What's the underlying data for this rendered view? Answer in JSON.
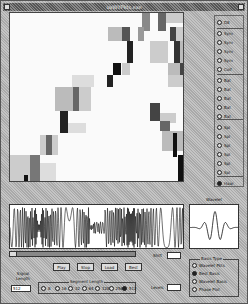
{
  "window": {
    "title": "uvWlfPkts.exe"
  },
  "plot": {
    "type": "time-frequency tiling",
    "cells": [
      {
        "x": 132,
        "y": 0,
        "w": 8,
        "h": 18,
        "c": "#888"
      },
      {
        "x": 148,
        "y": 0,
        "w": 8,
        "h": 18,
        "c": "#666"
      },
      {
        "x": 156,
        "y": 0,
        "w": 18,
        "h": 10,
        "c": "#ccc"
      },
      {
        "x": 98,
        "y": 14,
        "w": 16,
        "h": 14,
        "c": "#bbb"
      },
      {
        "x": 112,
        "y": 14,
        "w": 8,
        "h": 14,
        "c": "#555"
      },
      {
        "x": 128,
        "y": 14,
        "w": 6,
        "h": 14,
        "c": "#999"
      },
      {
        "x": 160,
        "y": 14,
        "w": 6,
        "h": 14,
        "c": "#444"
      },
      {
        "x": 166,
        "y": 14,
        "w": 8,
        "h": 14,
        "c": "#ccc"
      },
      {
        "x": 117,
        "y": 28,
        "w": 6,
        "h": 22,
        "c": "#222"
      },
      {
        "x": 140,
        "y": 28,
        "w": 18,
        "h": 22,
        "c": "#ccc"
      },
      {
        "x": 164,
        "y": 28,
        "w": 6,
        "h": 22,
        "c": "#333"
      },
      {
        "x": 170,
        "y": 28,
        "w": 8,
        "h": 22,
        "c": "#bbb"
      },
      {
        "x": 103,
        "y": 50,
        "w": 8,
        "h": 12,
        "c": "#111"
      },
      {
        "x": 112,
        "y": 50,
        "w": 8,
        "h": 12,
        "c": "#ccc"
      },
      {
        "x": 158,
        "y": 50,
        "w": 20,
        "h": 12,
        "c": "#bbb"
      },
      {
        "x": 170,
        "y": 50,
        "w": 6,
        "h": 12,
        "c": "#444"
      },
      {
        "x": 62,
        "y": 62,
        "w": 22,
        "h": 12,
        "c": "#ddd"
      },
      {
        "x": 97,
        "y": 62,
        "w": 6,
        "h": 12,
        "c": "#222"
      },
      {
        "x": 158,
        "y": 62,
        "w": 22,
        "h": 12,
        "c": "#ccc"
      },
      {
        "x": 45,
        "y": 74,
        "w": 18,
        "h": 24,
        "c": "#bbb"
      },
      {
        "x": 63,
        "y": 74,
        "w": 6,
        "h": 24,
        "c": "#666"
      },
      {
        "x": 69,
        "y": 74,
        "w": 12,
        "h": 24,
        "c": "#ccc"
      },
      {
        "x": 50,
        "y": 98,
        "w": 8,
        "h": 22,
        "c": "#222"
      },
      {
        "x": 58,
        "y": 110,
        "w": 18,
        "h": 10,
        "c": "#ddd"
      },
      {
        "x": 140,
        "y": 90,
        "w": 10,
        "h": 18,
        "c": "#444"
      },
      {
        "x": 150,
        "y": 100,
        "w": 16,
        "h": 10,
        "c": "#ccc"
      },
      {
        "x": 150,
        "y": 108,
        "w": 10,
        "h": 10,
        "c": "#666"
      },
      {
        "x": 30,
        "y": 122,
        "w": 18,
        "h": 20,
        "c": "#ccc"
      },
      {
        "x": 36,
        "y": 122,
        "w": 6,
        "h": 20,
        "c": "#666"
      },
      {
        "x": 152,
        "y": 118,
        "w": 26,
        "h": 20,
        "c": "#bbb"
      },
      {
        "x": 163,
        "y": 120,
        "w": 4,
        "h": 24,
        "c": "#111"
      },
      {
        "x": 0,
        "y": 142,
        "w": 22,
        "h": 28,
        "c": "#ccc"
      },
      {
        "x": 20,
        "y": 142,
        "w": 10,
        "h": 28,
        "c": "#777"
      },
      {
        "x": 30,
        "y": 150,
        "w": 16,
        "h": 18,
        "c": "#ddd"
      },
      {
        "x": 14,
        "y": 162,
        "w": 4,
        "h": 8,
        "c": "#111"
      },
      {
        "x": 168,
        "y": 142,
        "w": 6,
        "h": 26,
        "c": "#111"
      },
      {
        "x": 174,
        "y": 150,
        "w": 4,
        "h": 18,
        "c": "#ccc"
      }
    ]
  },
  "level_panel": {
    "items": [
      {
        "label": "D8",
        "selected": false
      },
      {
        "label": "Sym",
        "selected": false
      },
      {
        "label": "Sym",
        "selected": false
      },
      {
        "label": "Sym",
        "selected": false
      },
      {
        "label": "Sym",
        "selected": false
      },
      {
        "label": "Coif",
        "selected": false
      },
      {
        "label": "Bat",
        "selected": false
      },
      {
        "label": "Bat",
        "selected": false
      },
      {
        "label": "Bat",
        "selected": false
      },
      {
        "label": "Bat",
        "selected": false
      },
      {
        "label": "Bat",
        "selected": false
      },
      {
        "label": "Spl",
        "selected": false
      },
      {
        "label": "Spl",
        "selected": false
      },
      {
        "label": "Spl",
        "selected": false
      },
      {
        "label": "Spl",
        "selected": false
      },
      {
        "label": "Spl",
        "selected": false
      },
      {
        "label": "Spl",
        "selected": false
      },
      {
        "label": "Haar",
        "selected": true
      }
    ]
  },
  "wavelet_preview": {
    "title": "Wavelet"
  },
  "controls": {
    "play_label": "Play",
    "stop_label": "Stop",
    "load_label": "Load",
    "best_label": "Best",
    "shift_label": "Shift",
    "shift_value": "",
    "levels_label": "Levels",
    "levels_value": "",
    "signal_length_label": "Signal Length",
    "signal_length_value": "512",
    "segment_length_title": "Segment Length",
    "segment_options": [
      "8",
      "16",
      "32",
      "64",
      "128",
      "256",
      "512"
    ],
    "segment_selected_index": 6
  },
  "tree_type": {
    "title": "Basis Type",
    "options": [
      {
        "label": "Wavelet Pkts",
        "selected": false
      },
      {
        "label": "Best Basis",
        "selected": true
      },
      {
        "label": "Wavelet Basis",
        "selected": false
      },
      {
        "label": "Phase Plot",
        "selected": false
      }
    ]
  }
}
